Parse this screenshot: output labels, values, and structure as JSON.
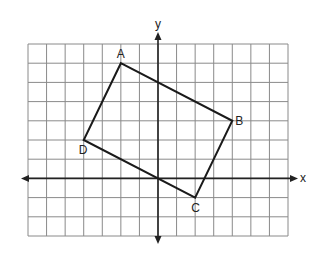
{
  "diagram": {
    "type": "coordinate-plane",
    "axes": {
      "x_label": "x",
      "y_label": "y",
      "x_range": [
        -7,
        7
      ],
      "y_range": [
        -3,
        7
      ],
      "grid": true,
      "grid_step": 1,
      "tick_labels": false
    },
    "polygon": {
      "name": "ABCD",
      "shape": "rectangle",
      "vertices": [
        {
          "label": "A",
          "x": -2,
          "y": 6
        },
        {
          "label": "B",
          "x": 4,
          "y": 3
        },
        {
          "label": "C",
          "x": 2,
          "y": -1
        },
        {
          "label": "D",
          "x": -4,
          "y": 2
        }
      ]
    },
    "colors": {
      "grid": "#8a8a8a",
      "axes": "#222222",
      "polygon": "#1a1a1a",
      "background": "#ffffff"
    }
  }
}
